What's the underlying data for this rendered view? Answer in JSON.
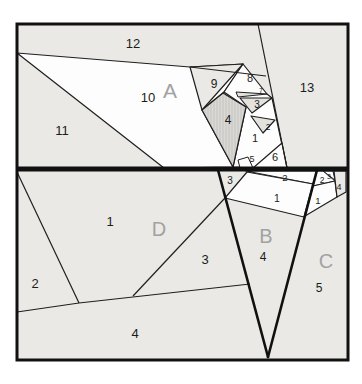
{
  "diagram": {
    "kind": "paper-piecing-pattern",
    "sections": {
      "a": {
        "letter": "A",
        "r1": "1",
        "r2": "2",
        "r3": "3",
        "r4": "4",
        "r5": "5",
        "r6": "6",
        "r7": "7",
        "r8": "8",
        "r9": "9",
        "r10": "10",
        "r11": "11",
        "r12": "12",
        "r13": "13"
      },
      "b": {
        "letter": "B",
        "r1": "1",
        "r2": "2",
        "r3": "3",
        "r4": "4"
      },
      "c": {
        "letter": "C",
        "r1": "1",
        "r2": "2",
        "r3": "3",
        "r4": "4",
        "r5": "5"
      },
      "d": {
        "letter": "D",
        "r1": "1",
        "r2": "2",
        "r3": "3",
        "r4": "4"
      }
    },
    "colors": {
      "background": "#ffffff",
      "piece_light": "#eae9e5",
      "piece_white": "#fdfdfd",
      "piece_tint": "#e3e2dd",
      "piece_hatched_base": "#dad9d5",
      "piece_hatch_line": "#c6c5c1",
      "outline": "#1f1f1f",
      "bold_outline": "#111111",
      "section_letter": "#a2a2a2",
      "number_text": "#1c1c1c"
    }
  }
}
